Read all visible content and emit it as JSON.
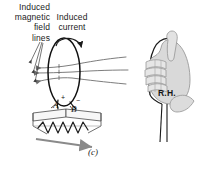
{
  "figure": {
    "caption": "(c)",
    "background_color": "#ffffff",
    "ink_color": "#1a1a1a",
    "field_line_color": "#6e6e6e",
    "hand_fill_color": "#d9d9d9",
    "hand_outline_color": "#9a9a9a",
    "resistor_fill_color": "#f2f2f2"
  },
  "labels": {
    "magnetic_field_lines": "Induced\nmagnetic\nfield\nlines",
    "magnetic_field_lines_line1": "Induced",
    "magnetic_field_lines_line2": "magnetic",
    "magnetic_field_lines_line3": "field",
    "magnetic_field_lines_line4": "lines",
    "induced_current_line1": "Induced",
    "induced_current_line2": "current",
    "terminal_a": "A",
    "terminal_b": "B",
    "sign_positive": "+",
    "sign_negative": "−",
    "right_hand": "R.H."
  },
  "elements": {
    "coil_name": "induced-current-coil",
    "field_lines_count": 3,
    "field_line_direction": "left",
    "current_arrow_direction": "counterclockwise-over-top",
    "resistor_name": "resistor-block",
    "hand_name": "right-hand-grip",
    "wire_pair_name": "lead-wires"
  }
}
